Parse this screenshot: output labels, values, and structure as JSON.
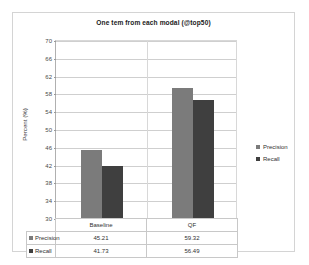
{
  "chart_data": {
    "type": "bar",
    "title": "One tem from each modal (@top50)",
    "xlabel": "",
    "ylabel": "Percent (%)",
    "ylim": [
      30,
      70
    ],
    "ytick_step": 4,
    "yticks": [
      70,
      66,
      62,
      58,
      54,
      50,
      46,
      42,
      38,
      34,
      30
    ],
    "grid": true,
    "legend_position": "right",
    "categories": [
      "Baseline",
      "QF"
    ],
    "series": [
      {
        "name": "Precision",
        "values": [
          45.21,
          59.32
        ],
        "color": "#7b7b7b"
      },
      {
        "name": "Recall",
        "values": [
          41.73,
          56.49
        ],
        "color": "#3f3f3f"
      }
    ],
    "data_table": {
      "visible": true,
      "column_headers": [
        "Baseline",
        "QF"
      ],
      "rows": [
        {
          "label": "Precision",
          "values": [
            "45.21",
            "59.32"
          ]
        },
        {
          "label": "Recall",
          "values": [
            "41.73",
            "56.49"
          ]
        }
      ]
    }
  }
}
